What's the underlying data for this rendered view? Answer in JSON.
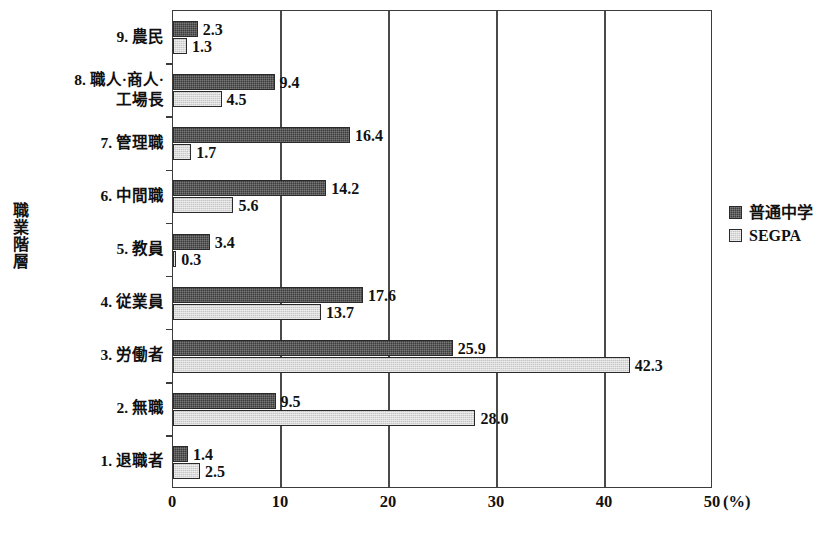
{
  "chart_data": {
    "type": "bar",
    "orientation": "horizontal",
    "title": "",
    "xlabel": "(%)",
    "ylabel": "職業階層",
    "xlim": [
      0,
      50
    ],
    "xticks": [
      0,
      10,
      20,
      30,
      40,
      50
    ],
    "xtick_labels": [
      "0",
      "10",
      "20",
      "30",
      "40",
      "50"
    ],
    "grid": true,
    "grid_axis": "x",
    "legend_position": "right",
    "categories": [
      "9.  農民",
      "8.  職人·商人·\n工場長",
      "7.  管理職",
      "6.  中間職",
      "5.  教員",
      "4.  従業員",
      "3.  労働者",
      "2.  無職",
      "1.  退職者"
    ],
    "series": [
      {
        "name": "普通中学",
        "color": "#3c3c3c",
        "values": [
          2.3,
          9.4,
          16.4,
          14.2,
          3.4,
          17.6,
          25.9,
          9.5,
          1.4
        ],
        "value_labels": [
          "2.3",
          "9.4",
          "16.4",
          "14.2",
          "3.4",
          "17.6",
          "25.9",
          "9.5",
          "1.4"
        ]
      },
      {
        "name": "SEGPA",
        "color": "#c6c6c6",
        "values": [
          1.3,
          4.5,
          1.7,
          5.6,
          0.3,
          13.7,
          42.3,
          28.0,
          2.5
        ],
        "value_labels": [
          "1.3",
          "4.5",
          "1.7",
          "5.6",
          "0.3",
          "13.7",
          "42.3",
          "28.0",
          "2.5"
        ]
      }
    ]
  },
  "axis": {
    "y_title": "職業階層",
    "x_unit": "(%)"
  },
  "legend": {
    "items": [
      {
        "label": "普通中学",
        "swatch": "dark-dither-swatch"
      },
      {
        "label": "SEGPA",
        "swatch": "light-dither-swatch"
      }
    ]
  },
  "source_note": {
    "text": ""
  }
}
